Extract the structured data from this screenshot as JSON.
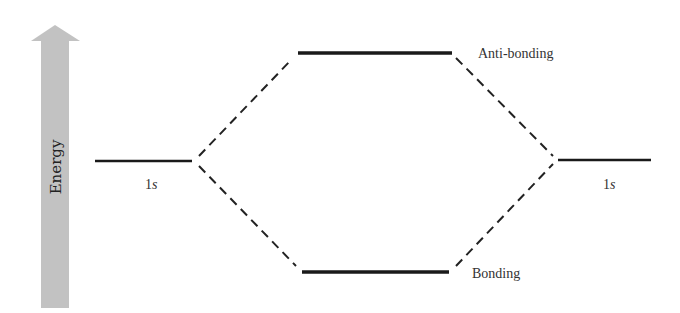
{
  "diagram": {
    "axis": {
      "label": "Energy",
      "arrow_color": "#c0c0c0"
    },
    "left_orbital": {
      "label_num": "1",
      "label_sub": "s"
    },
    "right_orbital": {
      "label_num": "1",
      "label_sub": "s"
    },
    "antibonding": {
      "label": "Anti-bonding"
    },
    "bonding": {
      "label": "Bonding"
    },
    "colors": {
      "line": "#1a1a1a",
      "dash": "#222222"
    }
  }
}
